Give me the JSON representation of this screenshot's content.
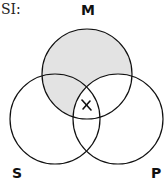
{
  "title": "SI:",
  "labels": {
    "m": "M",
    "s": "S",
    "p": "P"
  },
  "diagram": {
    "type": "venn-3",
    "circles": [
      {
        "name": "M",
        "cx": 87,
        "cy": 74,
        "r": 45
      },
      {
        "name": "S",
        "cx": 55,
        "cy": 119,
        "r": 45
      },
      {
        "name": "P",
        "cx": 118,
        "cy": 119,
        "r": 45
      }
    ],
    "shaded_regions": [
      "M only",
      "M∩S not P"
    ],
    "marked_regions": [
      {
        "region": "M∩S∩P",
        "mark": "X"
      }
    ],
    "shade_color": "#e3e3e3",
    "stroke_color": "#111111"
  }
}
